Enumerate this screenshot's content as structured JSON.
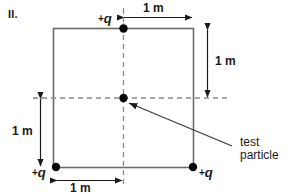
{
  "figure": {
    "label": "II.",
    "colors": {
      "ink": "#1a1a1a",
      "square_stroke": "#6b6b6b",
      "dashed_stroke": "#8a8a8a",
      "dot_fill": "#000000",
      "background": "#ffffff"
    }
  },
  "charges": [
    {
      "id": "top-center",
      "label": "+q",
      "sign": "+",
      "symbol": "q",
      "x_m": 0.0,
      "y_m": 1.0
    },
    {
      "id": "bottom-left",
      "label": "+q",
      "sign": "+",
      "symbol": "q",
      "x_m": -1.0,
      "y_m": -1.0
    },
    {
      "id": "bottom-right",
      "label": "+q",
      "sign": "+",
      "symbol": "q",
      "x_m": 1.0,
      "y_m": -1.0
    }
  ],
  "test_particle": {
    "label_line1": "test",
    "label_line2": "particle",
    "x_m": 0.0,
    "y_m": 0.0
  },
  "dimensions": [
    {
      "id": "top",
      "label": "1 m",
      "orientation": "horizontal",
      "from": "top-center-charge",
      "to": "top-right-corner"
    },
    {
      "id": "right",
      "label": "1 m",
      "orientation": "vertical",
      "from": "top-right-corner",
      "to": "mid-right"
    },
    {
      "id": "left",
      "label": "1 m",
      "orientation": "vertical",
      "from": "mid-left",
      "to": "bottom-left-charge"
    },
    {
      "id": "bottom",
      "label": "1 m",
      "orientation": "horizontal",
      "from": "bottom-left-charge",
      "to": "bottom-center"
    }
  ],
  "axes": {
    "vertical_dashed": true,
    "horizontal_dashed": true
  }
}
